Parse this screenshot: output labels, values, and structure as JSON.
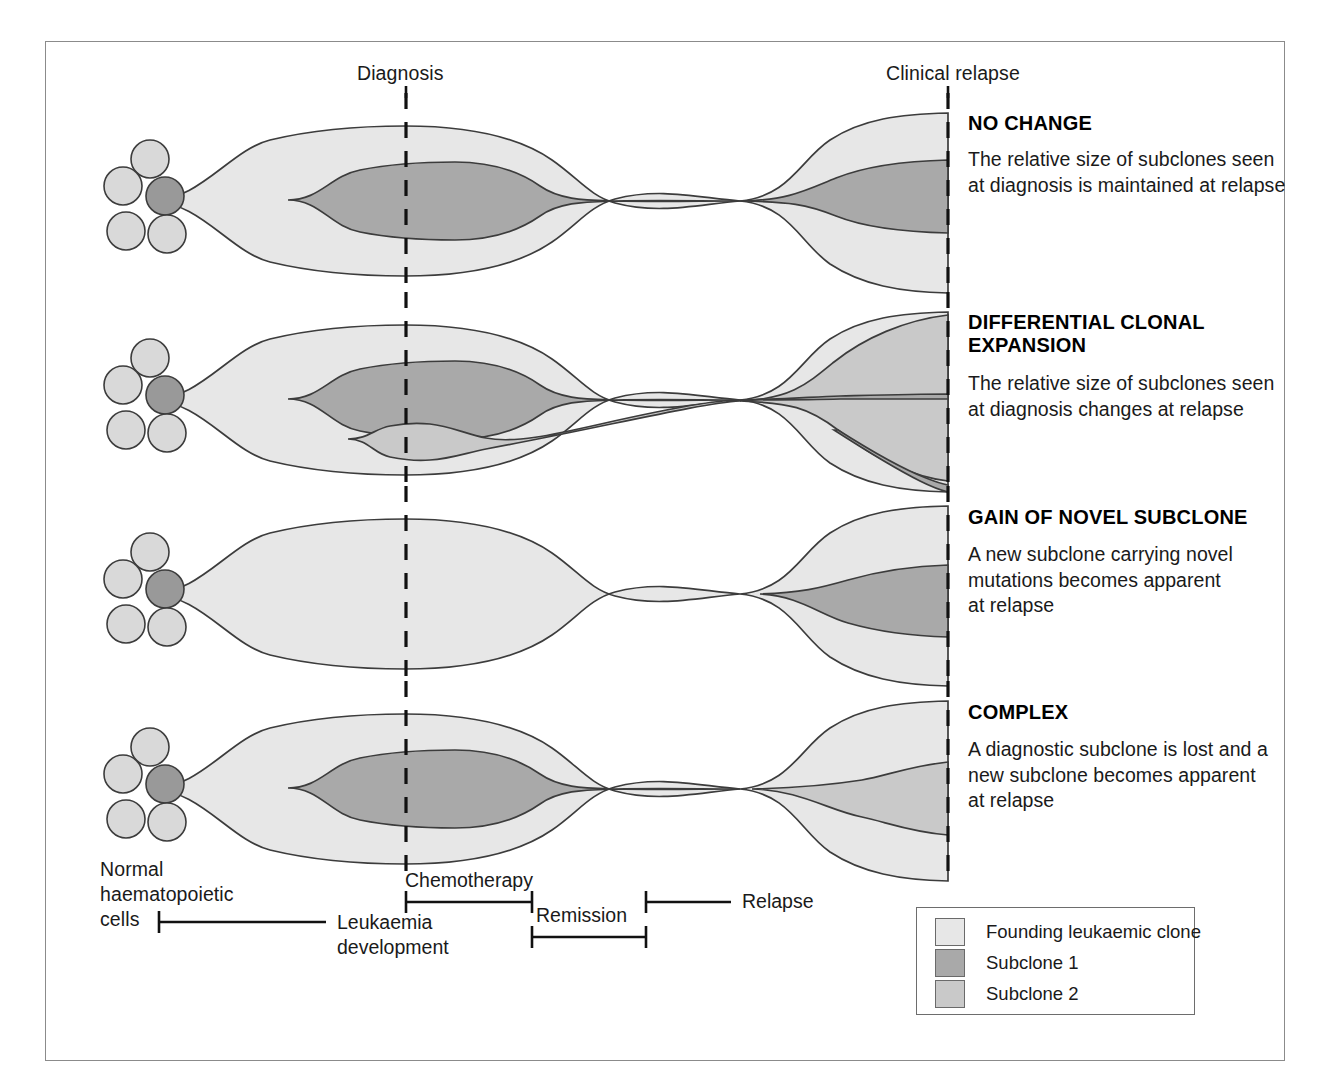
{
  "figure": {
    "type": "diagram",
    "timeline_top": {
      "diagnosis_label": "Diagnosis",
      "relapse_label": "Clinical relapse"
    },
    "cell_cluster_label": "Normal\nhaematopoietic\ncells",
    "cell_cluster_lines": [
      "Normal",
      "haematopoietic",
      "cells"
    ],
    "panels": [
      {
        "id": "no-change",
        "title": "NO CHANGE",
        "description_lines": [
          "The relative size of subclones seen",
          "at diagnosis is maintained at relapse"
        ]
      },
      {
        "id": "differential-clonal-expansion",
        "title_lines": [
          "DIFFERENTIAL CLONAL",
          "EXPANSION"
        ],
        "title": "DIFFERENTIAL CLONAL EXPANSION",
        "description_lines": [
          "The relative size of subclones seen",
          "at diagnosis changes at relapse"
        ]
      },
      {
        "id": "gain-of-novel-subclone",
        "title": "GAIN OF NOVEL SUBCLONE",
        "description_lines": [
          "A new subclone carrying novel",
          "mutations becomes apparent",
          "at relapse"
        ]
      },
      {
        "id": "complex",
        "title": "COMPLEX",
        "description_lines": [
          "A diagnostic subclone is lost and a",
          "new subclone becomes apparent",
          "at relapse"
        ]
      }
    ],
    "phase_brackets": [
      {
        "id": "chemotherapy",
        "label": "Chemotherapy",
        "label_position": "above"
      },
      {
        "id": "relapse",
        "label": "Relapse",
        "label_position": "right"
      },
      {
        "id": "remission",
        "label": "Remission",
        "label_position": "above"
      },
      {
        "id": "leukaemia-development",
        "label": "Leukaemia development",
        "label_lines": [
          "Leukaemia",
          "development"
        ],
        "label_position": "right"
      }
    ],
    "legend": {
      "items": [
        {
          "label": "Founding leukaemic clone",
          "color": "#e7e7e7"
        },
        {
          "label": "Subclone 1",
          "color": "#a9a9a9"
        },
        {
          "label": "Subclone 2",
          "color": "#c9c9c9"
        }
      ]
    },
    "colors": {
      "founding_clone": "#e7e7e7",
      "subclone_1": "#a9a9a9",
      "subclone_2": "#c9c9c9",
      "normal_cell": "#d9d9d9",
      "mutated_cell": "#999999",
      "outline": "#3c3c3c",
      "frame": "#8b8b8b",
      "text": "#1a1a1a"
    }
  }
}
